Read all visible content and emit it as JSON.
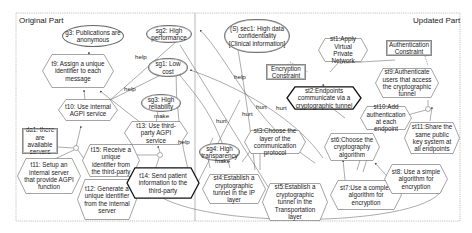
{
  "parts": {
    "left_title": "Original Part",
    "right_title": "Updated Part"
  },
  "nodes": {
    "g3": "g3: Publications are anonymous",
    "t9": "t9: Assign a unique identifier to each message",
    "t10": "t10: Use internal AGPI service",
    "da1": "da1: there are available servers",
    "t11": "t11: Setup an internal server that provide AGPI function",
    "t12": "t12: Generate a unique identifier from the internal server",
    "t15": "t15: Receive a unique identifier from the third-party",
    "t13": "t13: Use third-party AGPI service",
    "t14": "t14: Send patient information to the third-party",
    "sg2": "sg2: High performance",
    "sg1": "sg1: Low cost",
    "sg3": "sg3: High reliability",
    "sg4": "sg4: High transparency",
    "sec1": "(S) sec1: High data confidentiality [Clinical information]",
    "enc_constraint": "Encryption Constraint",
    "auth_constraint": "Authentication Constraint",
    "st1": "st1:Apply Virtual Private Network",
    "st2": "st2:Endpoints communicate via a cryptographic tunnel",
    "st9": "st9:Authenticate users that access the cryptographic tunnel",
    "st10": "st10:Add authentication at each endpoint",
    "st11": "st11:Share the same public key system at all endpoints",
    "st3": "st3:Choose the layer of the communication protocol",
    "st6": "st6:Choose the cryptography algorithm",
    "st4": "st4:Establish a cryptographic tunnel in the IP layer",
    "st5": "st5:Establish a cryptographic tunnel in the Transportation layer",
    "st7": "st7:Use a complex algorithm for encryption",
    "st8": "st8: Use a simple algorithm for encryption"
  },
  "edge_labels": {
    "help1": "help",
    "help2": "help",
    "help3": "help",
    "help4": "help",
    "make1": "make",
    "make2": "make",
    "hurt1": "hurt",
    "hurt2": "hurt",
    "hurt3": "hurt",
    "hurt4": "hurt"
  },
  "colors": {
    "stroke": "#555555",
    "frame": "#999999",
    "background": "#ffffff"
  }
}
